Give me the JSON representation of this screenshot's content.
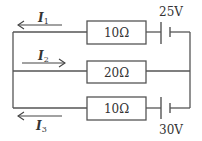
{
  "diagram": {
    "type": "circuit",
    "branches": [
      {
        "id": "top",
        "resistor": {
          "label": "10Ω",
          "ohms": 10
        },
        "battery": {
          "label": "25V",
          "volts": 25
        },
        "current": {
          "symbol": "I",
          "subscript": "1",
          "direction": "left"
        }
      },
      {
        "id": "middle",
        "resistor": {
          "label": "20Ω",
          "ohms": 20
        },
        "current": {
          "symbol": "I",
          "subscript": "2",
          "direction": "right"
        }
      },
      {
        "id": "bottom",
        "resistor": {
          "label": "10Ω",
          "ohms": 10
        },
        "battery": {
          "label": "30V",
          "volts": 30
        },
        "current": {
          "symbol": "I",
          "subscript": "3",
          "direction": "left"
        }
      }
    ],
    "colors": {
      "wire": "#555555",
      "text": "#333333",
      "background": "#ffffff"
    }
  }
}
